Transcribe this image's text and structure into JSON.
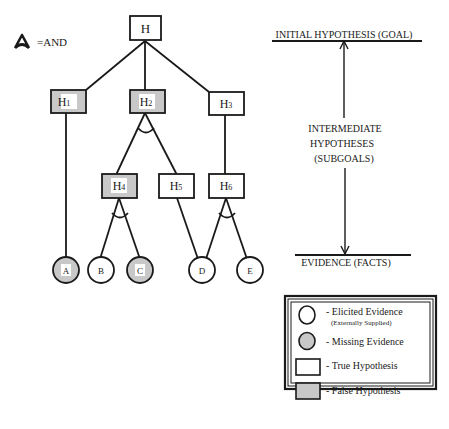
{
  "legend_and": {
    "symbol": "and-arc-icon",
    "label": "=AND"
  },
  "tree": {
    "nodes": [
      {
        "id": "H",
        "label": "H",
        "sub": "",
        "type": "hypothesis",
        "status": "true"
      },
      {
        "id": "H1",
        "label": "H",
        "sub": "1",
        "type": "hypothesis",
        "status": "false"
      },
      {
        "id": "H2",
        "label": "H",
        "sub": "2",
        "type": "hypothesis",
        "status": "false"
      },
      {
        "id": "H3",
        "label": "H",
        "sub": "3",
        "type": "hypothesis",
        "status": "true"
      },
      {
        "id": "H4",
        "label": "H",
        "sub": "4",
        "type": "hypothesis",
        "status": "false"
      },
      {
        "id": "H5",
        "label": "H",
        "sub": "5",
        "type": "hypothesis",
        "status": "true"
      },
      {
        "id": "H6",
        "label": "H",
        "sub": "6",
        "type": "hypothesis",
        "status": "true"
      },
      {
        "id": "A",
        "label": "A",
        "type": "evidence",
        "status": "missing"
      },
      {
        "id": "B",
        "label": "B",
        "type": "evidence",
        "status": "elicited"
      },
      {
        "id": "C",
        "label": "C",
        "type": "evidence",
        "status": "missing"
      },
      {
        "id": "D",
        "label": "D",
        "type": "evidence",
        "status": "elicited"
      },
      {
        "id": "E",
        "label": "E",
        "type": "evidence",
        "status": "elicited"
      }
    ],
    "edges": [
      [
        "H",
        "H1"
      ],
      [
        "H",
        "H2"
      ],
      [
        "H",
        "H3"
      ],
      [
        "H1",
        "A"
      ],
      [
        "H2",
        "H4"
      ],
      [
        "H2",
        "H5"
      ],
      [
        "H3",
        "H6"
      ],
      [
        "H4",
        "B"
      ],
      [
        "H4",
        "C"
      ],
      [
        "H5",
        "D"
      ],
      [
        "H6",
        "D"
      ],
      [
        "H6",
        "E"
      ]
    ],
    "and_nodes": [
      "H2",
      "H4",
      "H6"
    ]
  },
  "scale": {
    "top_label": "INITIAL HYPOTHESIS (GOAL)",
    "middle_label": [
      "INTERMEDIATE",
      "HYPOTHESES",
      "(SUBGOALS)"
    ],
    "bottom_label": "EVIDENCE (FACTS)"
  },
  "legend": {
    "items": [
      {
        "shape": "circle",
        "fill": "white",
        "label": "- Elicited Evidence",
        "sublabel": "(Externally Supplied)"
      },
      {
        "shape": "circle",
        "fill": "gray",
        "label": "- Missing Evidence"
      },
      {
        "shape": "rect",
        "fill": "white",
        "label": "- True Hypothesis"
      },
      {
        "shape": "rect",
        "fill": "gray",
        "label": "- False Hypothesis"
      }
    ]
  },
  "colors": {
    "false_fill": "#c8c8c8",
    "missing_fill": "#c8c8c8",
    "stroke": "#1a1a1a",
    "label_bg": "#ffffff"
  }
}
